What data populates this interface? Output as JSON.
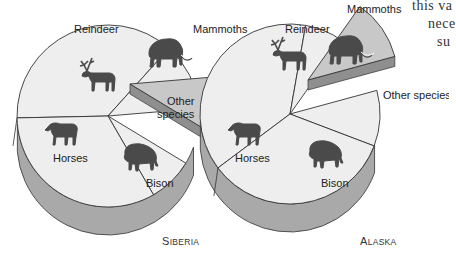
{
  "chart_data": [
    {
      "type": "pie",
      "title": "Siberia",
      "style": "3d-exploded",
      "slices": [
        {
          "label": "Horses",
          "value": 37,
          "icon": "horse-icon",
          "exploded": false
        },
        {
          "label": "Reindeer",
          "value": 12,
          "icon": "reindeer-icon",
          "exploded": false
        },
        {
          "label": "Mammoths",
          "value": 10,
          "icon": "mammoth-icon",
          "exploded": true
        },
        {
          "label": "Other species",
          "value": 8,
          "icon": null,
          "exploded": false
        },
        {
          "label": "Bison",
          "value": 33,
          "icon": "bison-icon",
          "exploded": false
        }
      ]
    },
    {
      "type": "pie",
      "title": "Alaska",
      "style": "3d-exploded",
      "slices": [
        {
          "label": "Horses",
          "value": 38,
          "icon": "horse-icon",
          "exploded": false
        },
        {
          "label": "Reindeer",
          "value": 7,
          "icon": "reindeer-icon",
          "exploded": false
        },
        {
          "label": "Mammoths",
          "value": 11,
          "icon": "mammoth-icon",
          "exploded": true
        },
        {
          "label": "Other species",
          "value": 10,
          "icon": null,
          "exploded": false
        },
        {
          "label": "Bison",
          "value": 34,
          "icon": "bison-icon",
          "exploded": false
        }
      ]
    }
  ],
  "colors": {
    "slice_fill": "#eeeeee",
    "exploded_fill": "#c8c8c8",
    "side_fill": "#a9a9a9",
    "outline": "#333333",
    "icon": "#4a4a4a"
  },
  "labels": {
    "siberia": {
      "reindeer": "Reindeer",
      "mammoths": "Mammoths",
      "other": [
        "Other",
        "species"
      ],
      "horses": "Horses",
      "bison": "Bison",
      "caption_first": "S",
      "caption_rest": "IBERIA"
    },
    "alaska": {
      "reindeer": "Reindeer",
      "mammoths": "Mammoths",
      "other": "Other species",
      "horses": "Horses",
      "bison": "Bison",
      "caption_first": "A",
      "caption_rest": "LASKA"
    }
  },
  "body_text": {
    "line1": "this va",
    "line2": "nece",
    "line3": "su"
  }
}
